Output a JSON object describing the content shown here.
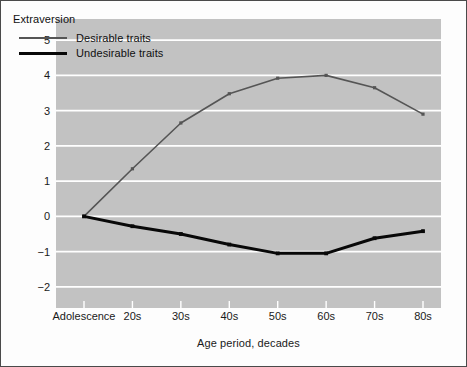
{
  "chart_data": {
    "type": "line",
    "title": "",
    "legend_title": "Extraversion",
    "legend_position": "top-left inside plot",
    "xlabel": "Age period, decades",
    "ylabel": "Perceived change over adulthood",
    "categories": [
      "Adolescence",
      "20s",
      "30s",
      "40s",
      "50s",
      "60s",
      "70s",
      "80s"
    ],
    "ytick_labels": [
      "5",
      "4",
      "3",
      "2",
      "1",
      "0",
      "−1",
      "−2"
    ],
    "ytick_values": [
      5,
      4,
      3,
      2,
      1,
      0,
      -1,
      -2
    ],
    "ylim": [
      -2.6,
      5.6
    ],
    "grid": "horizontal white gridlines at each integer tick",
    "series": [
      {
        "name": "Desirable traits",
        "color": "#555555",
        "line_width": 1.6,
        "marker": "square",
        "values": [
          0,
          1.35,
          2.65,
          3.48,
          3.92,
          4.0,
          3.65,
          2.9
        ]
      },
      {
        "name": "Undesirable traits",
        "color": "#080808",
        "line_width": 3.0,
        "marker": "square",
        "values": [
          0,
          -0.28,
          -0.5,
          -0.8,
          -1.05,
          -1.05,
          -0.62,
          -0.42
        ]
      }
    ]
  },
  "figure": {
    "plot_background": "#c2c2c2",
    "page_background": "#fdfdfd",
    "gridline_color": "#ffffff",
    "border_color": "#4a4a4a"
  }
}
